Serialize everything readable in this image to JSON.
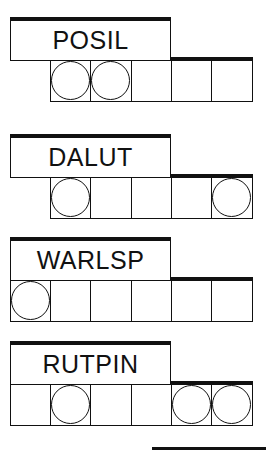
{
  "puzzle": {
    "type": "word-jumble",
    "rows": [
      {
        "word": "POSIL",
        "top": 17,
        "cells": [
          false,
          true,
          true,
          true,
          true,
          true
        ],
        "circles": [
          false,
          true,
          true,
          false,
          false,
          false
        ]
      },
      {
        "word": "DALUT",
        "top": 134,
        "cells": [
          false,
          true,
          true,
          true,
          true,
          true
        ],
        "circles": [
          false,
          true,
          false,
          false,
          false,
          true
        ]
      },
      {
        "word": "WARLSP",
        "top": 237,
        "cells": [
          true,
          true,
          true,
          true,
          true,
          true
        ],
        "circles": [
          true,
          false,
          false,
          false,
          false,
          false
        ]
      },
      {
        "word": "RUTPIN",
        "top": 341,
        "cells": [
          true,
          true,
          true,
          true,
          true,
          true
        ],
        "circles": [
          false,
          true,
          false,
          false,
          true,
          true
        ]
      }
    ]
  }
}
